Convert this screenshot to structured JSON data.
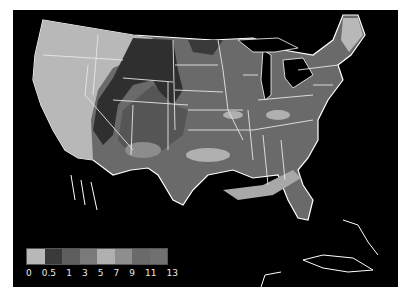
{
  "map": {
    "title": "",
    "region": "Contiguous United States",
    "background_color": "#000000",
    "border_color": "#ffffff"
  },
  "legend": {
    "labels": [
      "0",
      "0.5",
      "1",
      "3",
      "5",
      "7",
      "9",
      "11",
      "13"
    ],
    "swatches": [
      {
        "range": "0-0.5",
        "color": "#b8b8b8"
      },
      {
        "range": "0.5-1",
        "color": "#3a3a3a"
      },
      {
        "range": "1-3",
        "color": "#5e5e5e"
      },
      {
        "range": "3-5",
        "color": "#7a7a7a"
      },
      {
        "range": "5-7",
        "color": "#b0b0b0"
      },
      {
        "range": "7-9",
        "color": "#8e8e8e"
      },
      {
        "range": "9-11",
        "color": "#6a6a6a"
      },
      {
        "range": "11-13",
        "color": "#707070"
      }
    ]
  }
}
